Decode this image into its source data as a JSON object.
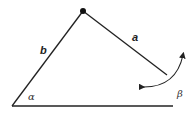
{
  "diagram": {
    "type": "geometry-angle-diagram",
    "labels": {
      "side_a": "a",
      "side_b": "b",
      "angle_alpha": "α",
      "angle_beta": "β"
    },
    "colors": {
      "stroke": "#222222",
      "background": "#ffffff"
    },
    "elements": [
      "apex-pivot-dot",
      "side-b-line",
      "side-a-line",
      "baseline",
      "rotation-arrow"
    ]
  }
}
